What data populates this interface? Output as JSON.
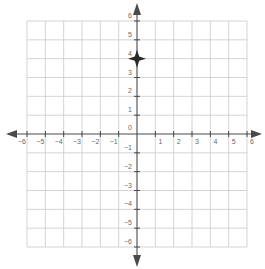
{
  "chart_data": {
    "type": "scatter",
    "title": "",
    "xlabel": "",
    "ylabel": "",
    "xlim": [
      -6,
      6
    ],
    "ylim": [
      -6,
      6
    ],
    "grid": true,
    "x_ticks": [
      -6,
      -5,
      -4,
      -3,
      -2,
      -1,
      1,
      2,
      3,
      4,
      5,
      6
    ],
    "x_tick_labels": [
      "−6",
      "−5",
      "−4",
      "−3",
      "−2",
      "−1",
      "1",
      "2",
      "3",
      "4",
      "5",
      "6"
    ],
    "y_ticks": [
      6,
      5,
      4,
      3,
      2,
      1,
      0,
      -1,
      -2,
      -3,
      -4,
      -5,
      -6
    ],
    "y_tick_labels": [
      "6",
      "5",
      "4",
      "3",
      "2",
      "1",
      "0",
      "−1",
      "−2",
      "−3",
      "−4",
      "−5",
      "−6"
    ],
    "points": [
      {
        "x": 0,
        "y": 4,
        "marker": "four-point-star"
      }
    ],
    "legend": null
  },
  "colors": {
    "grid": "#c9c9c9",
    "axis": "#4a4a4a",
    "label": "#6a6a6a",
    "point": "#2a2a2a"
  }
}
